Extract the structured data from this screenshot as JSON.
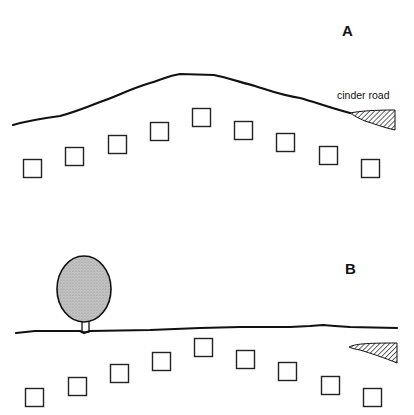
{
  "panels": [
    {
      "id": "A",
      "label": "A",
      "label_pos": [
        342,
        23
      ],
      "terrain": "hill",
      "terrain_path": "M13,125 C30,120 45,118 60,116 C75,112 90,106 100,102 C115,97 130,89 150,83 C165,78 172,75 180,74 L214,75 C225,77 240,82 255,86 C268,90 280,95 300,98 C315,102 330,108 350,113",
      "road_label": "cinder road",
      "road_label_pos": [
        337,
        90
      ],
      "road_hatch_path": "M350,113 C360,111 375,110 395,110 L395,130 C385,128 375,124 365,121 C358,118 353,115 350,113 Z",
      "squares": [
        {
          "x": 23,
          "y": 159
        },
        {
          "x": 65,
          "y": 147
        },
        {
          "x": 108,
          "y": 135
        },
        {
          "x": 150,
          "y": 122
        },
        {
          "x": 192,
          "y": 108
        },
        {
          "x": 234,
          "y": 121
        },
        {
          "x": 276,
          "y": 133
        },
        {
          "x": 319,
          "y": 146
        },
        {
          "x": 361,
          "y": 159
        }
      ]
    },
    {
      "id": "B",
      "label": "B",
      "label_pos": [
        345,
        261
      ],
      "terrain": "flat",
      "terrain_path": "M16,333 L35,331 L80,331 L84,333 L90,331 L150,330 L200,328 L240,327 L290,327 L310,326 L323,325 L335,326 L350,327 L397,328",
      "tree": {
        "cx": 84,
        "cy": 289,
        "rx": 27,
        "ry": 33,
        "trunk_x": 82,
        "trunk_y": 301,
        "trunk_w": 7,
        "trunk_h": 31,
        "fill": "#b8b8b8"
      },
      "road_hatch_path": "M349,347 C355,344 365,343 397,343 L397,363 C385,358 370,353 360,350 C354,349 351,348 349,347 Z",
      "squares": [
        {
          "x": 25,
          "y": 388
        },
        {
          "x": 68,
          "y": 377
        },
        {
          "x": 110,
          "y": 364
        },
        {
          "x": 152,
          "y": 352
        },
        {
          "x": 194,
          "y": 338
        },
        {
          "x": 236,
          "y": 350
        },
        {
          "x": 278,
          "y": 362
        },
        {
          "x": 321,
          "y": 376
        },
        {
          "x": 363,
          "y": 388
        }
      ]
    }
  ],
  "square_size": 18,
  "colors": {
    "ink": "#111111",
    "tree_fill": "#b8b8b8",
    "background": "#ffffff"
  }
}
